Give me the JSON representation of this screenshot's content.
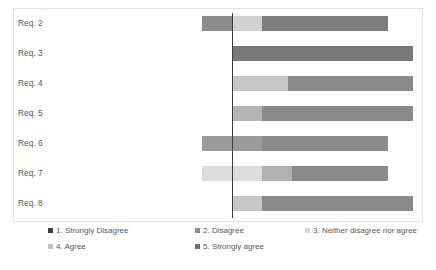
{
  "chart_data": {
    "type": "bar",
    "subtype": "diverging-stacked-likert",
    "title": "",
    "xlabel": "",
    "ylabel": "",
    "grid": false,
    "legend_position": "bottom",
    "axis": {
      "zero_line": true,
      "zero_line_color": "#3c3c3c",
      "ticks_visible": false,
      "xlim": [
        -40,
        100
      ]
    },
    "categories": [
      "Req. 2",
      "Req. 3",
      "Req. 4",
      "Req. 5",
      "Req. 6",
      "Req. 7",
      "Req. 8"
    ],
    "series": [
      {
        "name": "1. Strongly Disagree",
        "color": "#404040",
        "values": [
          0,
          0,
          0,
          0,
          0,
          0,
          0
        ]
      },
      {
        "name": "2. Disagree",
        "color": "#8c8c8c",
        "values": [
          20,
          0,
          0,
          0,
          40,
          0,
          0
        ]
      },
      {
        "name": "3. Neither disagree nor agree",
        "color": "#d4d4d4",
        "values": [
          20,
          0,
          37,
          20,
          0,
          60,
          20
        ]
      },
      {
        "name": "4. Agree",
        "color": "#a0a0a0",
        "values": [
          0,
          0,
          0,
          0,
          0,
          20,
          0
        ]
      },
      {
        "name": "5. Strongly agree",
        "color": "#7d7d7d",
        "values": [
          84,
          120,
          83,
          100,
          84,
          64,
          100
        ]
      }
    ],
    "rows": [
      {
        "category": "Req. 2",
        "segments": [
          {
            "series": "2. Disagree",
            "start": 202,
            "end": 232,
            "color": "#8c8c8c"
          },
          {
            "series": "3. Neither disagree nor agree",
            "start": 232,
            "end": 262,
            "color": "#d2d2d2"
          },
          {
            "series": "5. Strongly agree",
            "start": 262,
            "end": 388,
            "color": "#7d7d7d"
          }
        ]
      },
      {
        "category": "Req. 3",
        "segments": [
          {
            "series": "5. Strongly agree",
            "start": 232,
            "end": 413,
            "color": "#787878"
          }
        ]
      },
      {
        "category": "Req. 4",
        "segments": [
          {
            "series": "3. Neither disagree nor agree",
            "start": 232,
            "end": 288,
            "color": "#c6c6c6"
          },
          {
            "series": "5. Strongly agree",
            "start": 288,
            "end": 413,
            "color": "#8a8a8a"
          }
        ]
      },
      {
        "category": "Req. 5",
        "segments": [
          {
            "series": "3. Neither disagree nor agree",
            "start": 232,
            "end": 262,
            "color": "#b4b4b4"
          },
          {
            "series": "5. Strongly agree",
            "start": 262,
            "end": 413,
            "color": "#8a8a8a"
          }
        ]
      },
      {
        "category": "Req. 6",
        "segments": [
          {
            "series": "2. Disagree",
            "start": 202,
            "end": 262,
            "color": "#9a9a9a"
          },
          {
            "series": "5. Strongly agree",
            "start": 262,
            "end": 388,
            "color": "#8a8a8a"
          }
        ]
      },
      {
        "category": "Req. 7",
        "segments": [
          {
            "series": "3. Neither disagree nor agree",
            "start": 202,
            "end": 262,
            "color": "#dcdcdc"
          },
          {
            "series": "4. Agree",
            "start": 262,
            "end": 292,
            "color": "#b0b0b0"
          },
          {
            "series": "5. Strongly agree",
            "start": 292,
            "end": 388,
            "color": "#8a8a8a"
          }
        ]
      },
      {
        "category": "Req. 8",
        "segments": [
          {
            "series": "3. Neither disagree nor agree",
            "start": 232,
            "end": 262,
            "color": "#c6c6c6"
          },
          {
            "series": "5. Strongly agree",
            "start": 262,
            "end": 413,
            "color": "#8a8a8a"
          }
        ]
      }
    ]
  },
  "legend": {
    "items": [
      {
        "label": "1. Strongly Disagree",
        "color": "#404040"
      },
      {
        "label": "2. Disagree",
        "color": "#8c8c8c"
      },
      {
        "label": "3. Neither disagree nor agree",
        "color": "#d8d8d8"
      },
      {
        "label": "4. Agree",
        "color": "#c0c0c0"
      },
      {
        "label": "5. Strongly agree",
        "color": "#6e6e6e"
      }
    ]
  }
}
